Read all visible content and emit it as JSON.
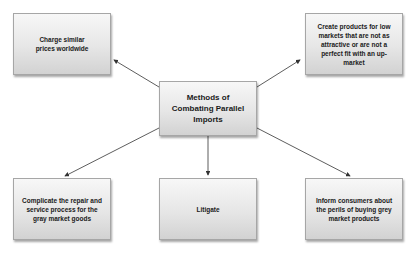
{
  "diagram": {
    "center": {
      "label": "Methods of Combating Parallel Imports"
    },
    "nodes": [
      {
        "id": "top-left",
        "label": "Charge similar prices worldwide"
      },
      {
        "id": "top-right",
        "label": "Create products for low markets that are not as attractive or are not a perfect fit with an up-market"
      },
      {
        "id": "bottom-left",
        "label": "Complicate the repair and service process for the gray market goods"
      },
      {
        "id": "bottom-center",
        "label": "Litigate"
      },
      {
        "id": "bottom-right",
        "label": "Inform consumers about the perils of buying grey market products"
      }
    ],
    "colors": {
      "box_border": "#a6a6a6",
      "box_top": "#f7f7f7",
      "box_bottom": "#d2d2d2",
      "arrow": "#333333",
      "text": "#1a1a1a"
    }
  }
}
